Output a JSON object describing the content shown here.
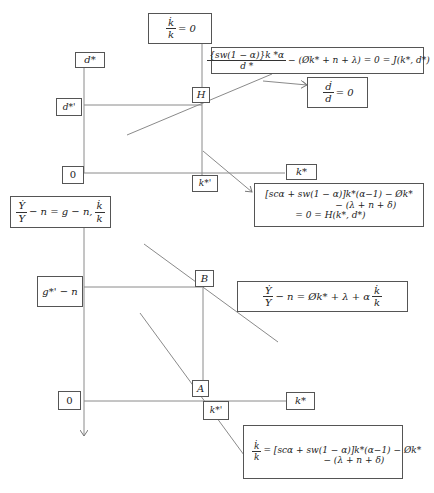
{
  "upper_panel": {
    "y_axis_label": "d*",
    "y_level_label": "d*'",
    "origin_label": "0",
    "x_axis_label": "k*",
    "x_level_label": "k*'",
    "intersection_label": "H",
    "kdot_zero": {
      "num": "k̇",
      "den": "k",
      "rhs": "= 0"
    },
    "ddot_zero": {
      "num": "ḋ",
      "den": "d",
      "rhs": "= 0"
    },
    "J_equation": {
      "num": "[s_w(1 − α)]k *^α",
      "num_display": "{sw(1 − α)}k *α",
      "den": "d *",
      "rhs": "− (Øk* + n + λ) = 0 = J(k*, d*)"
    },
    "H_equation": {
      "line1": "[scα + sw(1 − α)]k*(α−1) − Øk*",
      "line2": "− (λ + n + δ)",
      "line3": "= 0 = H(k*, d*)"
    }
  },
  "lower_panel": {
    "y_axis_equation": {
      "num": "Ẏ",
      "den": "Y",
      "mid": "− n = g − n,",
      "num2": "k̇",
      "den2": "k"
    },
    "y_level_label": "g*' − n",
    "origin_label": "0",
    "x_axis_label": "k*",
    "x_level_label": "k*'",
    "point_B_label": "B",
    "point_A_label": "A",
    "B_equation": {
      "num": "Ẏ",
      "den": "Y",
      "mid": "− n = Øk* + λ + α",
      "num2": "k̇",
      "den2": "k"
    },
    "A_equation": {
      "num": "k̇",
      "den": "k",
      "line1": "= [scα + sw(1 − α)]k*(α−1) − Øk*",
      "line2": "− (λ + n + δ)"
    }
  },
  "colors": {
    "line": "#8a8a8a",
    "box_border": "#555555",
    "text": "#222222",
    "background": "#ffffff"
  }
}
